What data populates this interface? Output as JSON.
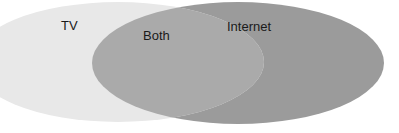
{
  "diagram": {
    "type": "venn",
    "sets": [
      {
        "id": "tv",
        "label": "TV",
        "color": "#e4e4e4"
      },
      {
        "id": "internet",
        "label": "Internet",
        "color": "#9b9b9b"
      }
    ],
    "intersection": {
      "label": "Both",
      "color": "#aaaaaa"
    }
  }
}
